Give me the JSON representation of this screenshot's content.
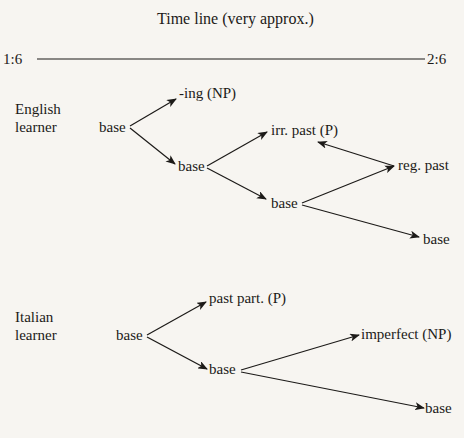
{
  "title": "Time line (very approx.)",
  "timeline": {
    "start": "1:6",
    "end": "2:6"
  },
  "english": {
    "learner_label": [
      "English",
      "learner"
    ],
    "nodes": {
      "root": "base",
      "ing": "-ing (NP)",
      "base2": "base",
      "irr_past": "irr. past (P)",
      "reg_past": "reg. past",
      "base3": "base",
      "base4": "base"
    },
    "edges": [
      {
        "from": "root",
        "to": "ing"
      },
      {
        "from": "root",
        "to": "base2"
      },
      {
        "from": "base2",
        "to": "irr_past"
      },
      {
        "from": "base2",
        "to": "base3"
      },
      {
        "from": "base3",
        "to": "reg_past"
      },
      {
        "from": "reg_past",
        "to": "irr_past"
      },
      {
        "from": "base3",
        "to": "base4"
      }
    ]
  },
  "italian": {
    "learner_label": [
      "Italian",
      "learner"
    ],
    "nodes": {
      "root": "base",
      "past_part": "past part. (P)",
      "base2": "base",
      "imperfect": "imperfect (NP)",
      "base3": "base"
    },
    "edges": [
      {
        "from": "root",
        "to": "past_part"
      },
      {
        "from": "root",
        "to": "base2"
      },
      {
        "from": "base2",
        "to": "imperfect"
      },
      {
        "from": "base2",
        "to": "base3"
      }
    ]
  }
}
